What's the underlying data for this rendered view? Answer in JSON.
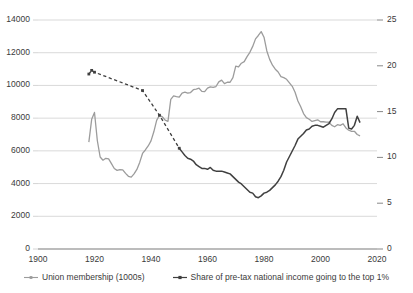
{
  "chart_data": {
    "type": "line",
    "title": "",
    "subtitle": "",
    "xlabel": "",
    "ylabel": "",
    "xlim": [
      1900,
      2020
    ],
    "xticks": [
      1900,
      1920,
      1940,
      1960,
      1980,
      2000,
      2020
    ],
    "xtick_labels": [
      "1900",
      "1920",
      "1940",
      "1960",
      "1980",
      "2000",
      "2020"
    ],
    "grid": true,
    "grid_axis": "y",
    "legend_position": "bottom",
    "y_left": {
      "label": "",
      "lim": [
        0,
        14000
      ],
      "ticks": [
        0,
        2000,
        4000,
        6000,
        8000,
        10000,
        12000,
        14000
      ],
      "tick_labels": [
        "0",
        "2000",
        "4000",
        "6000",
        "8000",
        "10000",
        "12000",
        "14000"
      ]
    },
    "y_right": {
      "label": "",
      "lim": [
        0,
        25
      ],
      "ticks": [
        0,
        5,
        10,
        15,
        20,
        25
      ],
      "tick_labels": [
        "0",
        "5",
        "10",
        "15",
        "20",
        "25"
      ]
    },
    "series": [
      {
        "name": "Union membership (1000s)",
        "axis": "left",
        "color": "#9c9c9c",
        "style": "solid",
        "marker": "none",
        "x": [
          1918,
          1919,
          1920,
          1921,
          1922,
          1923,
          1924,
          1925,
          1926,
          1927,
          1928,
          1929,
          1930,
          1931,
          1932,
          1933,
          1934,
          1935,
          1936,
          1937,
          1938,
          1939,
          1940,
          1941,
          1942,
          1943,
          1944,
          1945,
          1946,
          1947,
          1948,
          1949,
          1950,
          1951,
          1952,
          1953,
          1954,
          1955,
          1956,
          1957,
          1958,
          1959,
          1960,
          1961,
          1962,
          1963,
          1964,
          1965,
          1966,
          1967,
          1968,
          1969,
          1970,
          1971,
          1972,
          1973,
          1974,
          1975,
          1976,
          1977,
          1978,
          1979,
          1980,
          1981,
          1982,
          1983,
          1984,
          1985,
          1986,
          1987,
          1988,
          1989,
          1990,
          1991,
          1992,
          1993,
          1994,
          1995,
          1996,
          1997,
          1998,
          1999,
          2000,
          2001,
          2002,
          2003,
          2004,
          2005,
          2006,
          2007,
          2008,
          2009,
          2010,
          2011,
          2012,
          2013,
          2014
        ],
        "values": [
          6533,
          7926,
          8348,
          6633,
          5625,
          5429,
          5544,
          5506,
          5219,
          4919,
          4806,
          4858,
          4842,
          4624,
          4444,
          4392,
          4590,
          4867,
          5295,
          5842,
          6053,
          6298,
          6613,
          7165,
          7867,
          8174,
          8087,
          7875,
          7803,
          9145,
          9363,
          9318,
          9289,
          9535,
          9588,
          9527,
          9566,
          9741,
          9778,
          9829,
          9639,
          9623,
          9835,
          9916,
          9887,
          9934,
          10218,
          10325,
          10111,
          10193,
          10193,
          10479,
          11179,
          11128,
          11359,
          11456,
          11764,
          12026,
          12386,
          12846,
          13054,
          13289,
          12947,
          12106,
          11593,
          11236,
          10994,
          10821,
          10539,
          10475,
          10376,
          10158,
          9947,
          9585,
          9048,
          8700,
          8278,
          8031,
          7935,
          7801,
          7852,
          7898,
          7779,
          7779,
          7751,
          7751,
          7559,
          7473,
          7602,
          7560,
          7656,
          7400,
          7261,
          7197,
          7197,
          7000,
          6918
        ]
      },
      {
        "name": "Share of pre-tax national income going to the top 1%",
        "axis": "right",
        "color": "#404040",
        "style_early": "dashed",
        "style_late": "solid",
        "dash_break_year": 1950,
        "marker": "small-square",
        "x": [
          1918,
          1919,
          1920,
          1937,
          1943,
          1950,
          1951,
          1952,
          1953,
          1954,
          1955,
          1956,
          1957,
          1958,
          1959,
          1960,
          1961,
          1962,
          1963,
          1964,
          1965,
          1966,
          1967,
          1968,
          1969,
          1970,
          1971,
          1972,
          1973,
          1974,
          1975,
          1976,
          1977,
          1978,
          1979,
          1980,
          1981,
          1982,
          1983,
          1984,
          1985,
          1986,
          1987,
          1988,
          1989,
          1990,
          1991,
          1992,
          1993,
          1994,
          1995,
          1996,
          1997,
          1998,
          1999,
          2000,
          2001,
          2002,
          2003,
          2004,
          2005,
          2006,
          2007,
          2008,
          2009,
          2010,
          2011,
          2012,
          2013,
          2014
        ],
        "values": [
          19.1,
          19.5,
          19.3,
          17.3,
          14.6,
          11.0,
          10.6,
          10.2,
          9.9,
          9.8,
          9.6,
          9.2,
          9.0,
          8.8,
          8.8,
          8.7,
          8.9,
          8.6,
          8.5,
          8.5,
          8.5,
          8.4,
          8.3,
          8.2,
          7.9,
          7.6,
          7.3,
          7.1,
          6.8,
          6.5,
          6.2,
          6.1,
          5.7,
          5.6,
          5.8,
          6.1,
          6.2,
          6.4,
          6.7,
          7.0,
          7.4,
          7.9,
          8.6,
          9.5,
          10.1,
          10.7,
          11.3,
          12.0,
          12.3,
          12.6,
          13.0,
          13.1,
          13.4,
          13.5,
          13.5,
          13.4,
          13.3,
          13.5,
          13.7,
          14.2,
          14.9,
          15.3,
          15.3,
          15.3,
          15.3,
          13.2,
          13.1,
          13.5,
          14.5,
          13.8
        ]
      }
    ],
    "legend": [
      {
        "label": "Union membership (1000s)",
        "color": "#9c9c9c",
        "marker_icon": "line-marker-icon"
      },
      {
        "label": "Share of pre-tax national income going to the top 1%",
        "color": "#404040",
        "marker_icon": "line-marker-icon"
      }
    ]
  },
  "colors": {
    "union_line": "#9c9c9c",
    "top1_line": "#404040",
    "gridline": "#c9c9c9",
    "axis": "#7a7a7a",
    "text": "#3a3a3a",
    "background": "#ffffff"
  }
}
